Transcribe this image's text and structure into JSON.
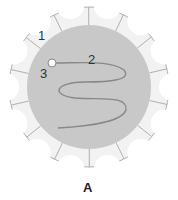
{
  "diagram": {
    "labels": [
      {
        "id": "1",
        "text": "1"
      },
      {
        "id": "2",
        "text": "2"
      },
      {
        "id": "3",
        "text": "3"
      }
    ],
    "caption": "A",
    "colors": {
      "fill": "#c8c8c8",
      "petal": "#f2f2f2",
      "stroke": "#9a9a9a",
      "wave": "#888888"
    }
  }
}
